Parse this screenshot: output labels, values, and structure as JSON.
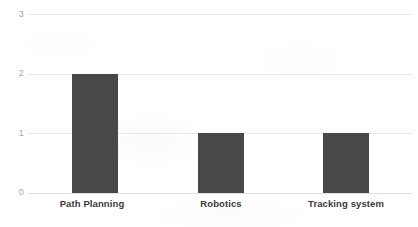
{
  "chart_data": {
    "type": "bar",
    "title": "",
    "subtitle": "",
    "xlabel": "",
    "ylabel": "",
    "categories": [
      "Path Planning",
      "Robotics",
      "Tracking system"
    ],
    "values": [
      2,
      1,
      1
    ],
    "series": [
      {
        "name": "count",
        "values": [
          2,
          1,
          1
        ]
      }
    ],
    "ylim": [
      0,
      3
    ],
    "yticks": [
      0,
      1,
      2,
      3
    ],
    "ytick_labels": [
      "0",
      "1",
      "2",
      "3"
    ],
    "grid": true,
    "grid_axis": "y",
    "legend": false,
    "legend_position": "none",
    "annotations": []
  },
  "style": {
    "bar_color": "#484848",
    "gridline_color": "#e9e9e9",
    "baseline_color": "#e2e2e2",
    "tick_label_color": "#a6a6a6",
    "category_label_color": "#3a3a3a",
    "background_color": "#ffffff"
  },
  "axis": {
    "y_tick_3": "3",
    "y_tick_2": "2",
    "y_tick_1": "1",
    "y_tick_0": "0"
  },
  "categories_text": {
    "cat_0": "Path Planning",
    "cat_1": "Robotics",
    "cat_2": "Tracking system"
  }
}
